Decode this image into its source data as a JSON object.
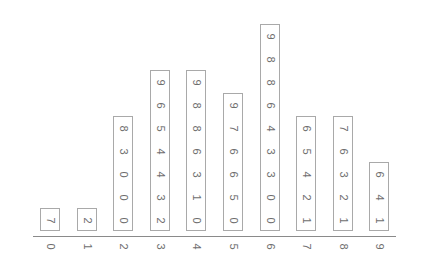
{
  "chart_data": {
    "type": "stem-and-leaf",
    "title": "",
    "xlabel": "",
    "ylabel": "",
    "orientation": "leaves stacked vertically above stems, text rotated 90 degrees",
    "grid": false,
    "legend": null,
    "stems": [
      "0",
      "1",
      "2",
      "3",
      "4",
      "5",
      "6",
      "7",
      "8",
      "9"
    ],
    "leaves": [
      [
        "7"
      ],
      [
        "2"
      ],
      [
        "0",
        "0",
        "0",
        "3",
        "8"
      ],
      [
        "2",
        "3",
        "4",
        "4",
        "5",
        "6",
        "9"
      ],
      [
        "0",
        "1",
        "3",
        "6",
        "8",
        "8",
        "9"
      ],
      [
        "0",
        "5",
        "6",
        "6",
        "7",
        "9"
      ],
      [
        "0",
        "0",
        "3",
        "3",
        "4",
        "6",
        "8",
        "8",
        "9"
      ],
      [
        "1",
        "2",
        "4",
        "5",
        "6"
      ],
      [
        "1",
        "2",
        "3",
        "6",
        "7"
      ],
      [
        "1",
        "4",
        "6"
      ]
    ],
    "counts": [
      1,
      1,
      5,
      7,
      7,
      6,
      9,
      5,
      5,
      3
    ],
    "values": [
      7,
      12,
      20,
      20,
      20,
      23,
      28,
      32,
      33,
      34,
      34,
      35,
      36,
      39,
      40,
      41,
      43,
      46,
      48,
      48,
      49,
      50,
      55,
      56,
      56,
      57,
      59,
      60,
      60,
      63,
      63,
      64,
      66,
      68,
      68,
      69,
      71,
      72,
      74,
      75,
      76,
      81,
      82,
      83,
      86,
      87,
      91,
      94,
      96
    ]
  },
  "colors": {
    "axis": "#8a8a8a",
    "box_border": "#a9a9a9",
    "text": "#6e6e6e",
    "background": "#ffffff"
  }
}
